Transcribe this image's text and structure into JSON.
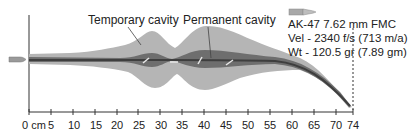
{
  "diagram": {
    "labels": {
      "temporary_cavity": "Temporary cavity",
      "permanent_cavity": "Permanent cavity"
    },
    "projectile": {
      "name": "AK-47 7.62 mm FMC",
      "velocity": "Vel - 2340 f/s (713 m/a)",
      "weight": "Wt - 120.5 gr (7.89 gm)",
      "icon": "bullet-icon"
    },
    "axis": {
      "unit_label": "0 cm",
      "ticks": [
        "0 cm",
        "5",
        "10",
        "15",
        "20",
        "25",
        "30",
        "35",
        "40",
        "45",
        "50",
        "55",
        "60",
        "65",
        "70",
        "74"
      ],
      "tick_values": [
        0,
        5,
        10,
        15,
        20,
        25,
        30,
        35,
        40,
        45,
        50,
        55,
        60,
        65,
        70,
        74
      ],
      "max": 74
    },
    "colors": {
      "temporary_cavity": "#b3b3b3",
      "permanent_cavity": "#6e6e6e",
      "track_core": "#4a4a4a",
      "axis": "#333333",
      "text": "#222222"
    }
  },
  "tick_labels": {
    "t0": "0 cm",
    "t5": "5",
    "t10": "10",
    "t15": "15",
    "t20": "20",
    "t25": "25",
    "t30": "30",
    "t35": "35",
    "t40": "40",
    "t45": "45",
    "t50": "50",
    "t55": "55",
    "t60": "60",
    "t65": "65",
    "t70": "70",
    "t74": "74"
  }
}
